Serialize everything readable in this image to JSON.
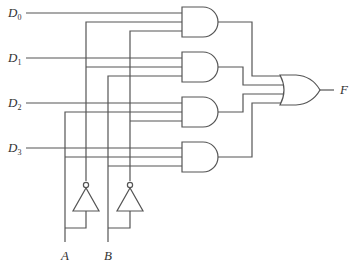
{
  "diagram": {
    "inputs": [
      {
        "name": "D",
        "sub": "0"
      },
      {
        "name": "D",
        "sub": "1"
      },
      {
        "name": "D",
        "sub": "2"
      },
      {
        "name": "D",
        "sub": "3"
      }
    ],
    "selects": [
      {
        "label": "A"
      },
      {
        "label": "B"
      }
    ],
    "output": {
      "label": "F"
    },
    "gates": {
      "and": [
        {
          "name": "AND0",
          "inputs": [
            "D0",
            "A'",
            "B'"
          ]
        },
        {
          "name": "AND1",
          "inputs": [
            "D1",
            "A'",
            "B"
          ]
        },
        {
          "name": "AND2",
          "inputs": [
            "D2",
            "A",
            "B'"
          ]
        },
        {
          "name": "AND3",
          "inputs": [
            "D3",
            "A",
            "B"
          ]
        }
      ],
      "or": {
        "name": "OR",
        "inputs": [
          "AND0",
          "AND1",
          "AND2",
          "AND3"
        ]
      },
      "not": [
        {
          "name": "NOT-A",
          "input": "A"
        },
        {
          "name": "NOT-B",
          "input": "B"
        }
      ]
    }
  }
}
